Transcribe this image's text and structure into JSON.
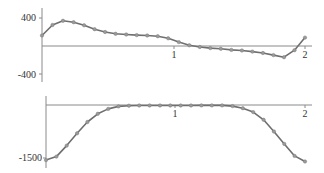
{
  "chart_data": [
    {
      "type": "line",
      "title": "",
      "xlabel": "",
      "ylabel": "",
      "x_ticks": [
        "1",
        "2"
      ],
      "y_ticks": [
        "400",
        "-400"
      ],
      "xlim": [
        0,
        2.05
      ],
      "ylim": [
        -450,
        450
      ],
      "grid": false,
      "markers": true,
      "x": [
        0,
        0.08,
        0.16,
        0.24,
        0.32,
        0.4,
        0.48,
        0.56,
        0.64,
        0.72,
        0.8,
        0.88,
        0.96,
        1.04,
        1.12,
        1.2,
        1.28,
        1.36,
        1.44,
        1.52,
        1.6,
        1.68,
        1.76,
        1.84,
        1.92,
        2.0
      ],
      "values": [
        150,
        300,
        360,
        340,
        295,
        240,
        200,
        175,
        165,
        155,
        150,
        140,
        110,
        55,
        10,
        -15,
        -30,
        -40,
        -55,
        -65,
        -80,
        -100,
        -130,
        -160,
        -60,
        120
      ]
    },
    {
      "type": "line",
      "title": "",
      "xlabel": "",
      "ylabel": "",
      "x_ticks": [
        "1",
        "2"
      ],
      "y_ticks": [
        "-1500"
      ],
      "xlim": [
        0,
        2.05
      ],
      "ylim": [
        -1750,
        50
      ],
      "grid": false,
      "markers": true,
      "x": [
        0,
        0.08,
        0.16,
        0.24,
        0.32,
        0.4,
        0.48,
        0.56,
        0.64,
        0.72,
        0.8,
        0.88,
        0.96,
        1.04,
        1.12,
        1.2,
        1.28,
        1.36,
        1.44,
        1.52,
        1.6,
        1.68,
        1.76,
        1.84,
        1.92,
        2.0
      ],
      "values": [
        -1560,
        -1460,
        -1150,
        -800,
        -480,
        -250,
        -110,
        -40,
        -20,
        -15,
        -15,
        -15,
        -15,
        -15,
        -15,
        -10,
        -10,
        -10,
        -30,
        -90,
        -200,
        -420,
        -750,
        -1100,
        -1440,
        -1600
      ]
    }
  ],
  "labels": {
    "top_y_max": "400",
    "top_y_min": "-400",
    "top_x_1": "1",
    "top_x_2": "2",
    "bottom_y_min": "-1500",
    "bottom_x_1": "1",
    "bottom_x_2": "2"
  }
}
